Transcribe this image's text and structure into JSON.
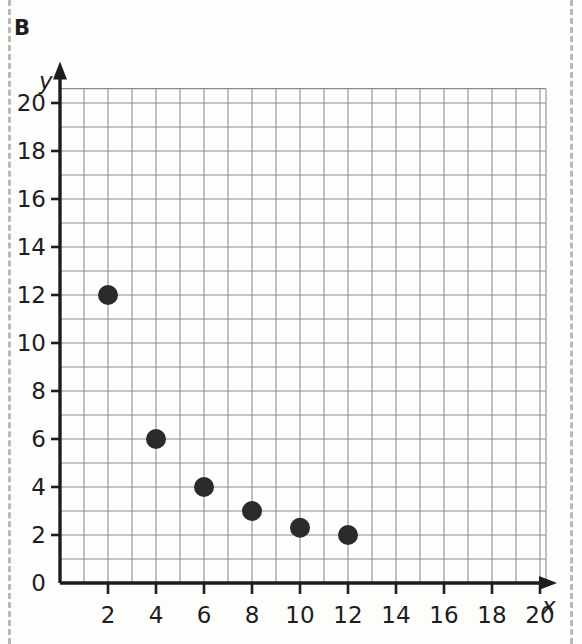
{
  "panel": {
    "letter": "B"
  },
  "chart_data": {
    "type": "scatter",
    "title": "",
    "subtitle": "",
    "xlabel": "x",
    "ylabel": "y",
    "xlim": [
      0,
      21
    ],
    "ylim": [
      0,
      21.5
    ],
    "grid": true,
    "grid_step": 1,
    "legend": null,
    "x_ticks": [
      2,
      4,
      6,
      8,
      10,
      12,
      14,
      16,
      18,
      20
    ],
    "x_tick_labels": [
      "2",
      "4",
      "6",
      "8",
      "10",
      "12",
      "14",
      "16",
      "18",
      "20"
    ],
    "y_ticks": [
      0,
      2,
      4,
      6,
      8,
      10,
      12,
      14,
      16,
      18,
      20
    ],
    "y_tick_labels": [
      "0",
      "2",
      "4",
      "6",
      "8",
      "10",
      "12",
      "14",
      "16",
      "18",
      "20"
    ],
    "origin_label": "0",
    "series": [
      {
        "name": "points",
        "marker": "filled-circle",
        "color": "#2b2b2b",
        "marker_radius": 10,
        "points": [
          {
            "x": 2,
            "y": 12
          },
          {
            "x": 4,
            "y": 6
          },
          {
            "x": 6,
            "y": 4
          },
          {
            "x": 8,
            "y": 3
          },
          {
            "x": 10,
            "y": 2.3
          },
          {
            "x": 12,
            "y": 2
          }
        ]
      }
    ],
    "colors": {
      "marker": "#2b2b2b",
      "grid": "#8e8e8e",
      "axis": "#1d1d1d",
      "crop_guide": "#b9b9b9",
      "background": "#fdfdfc"
    }
  }
}
